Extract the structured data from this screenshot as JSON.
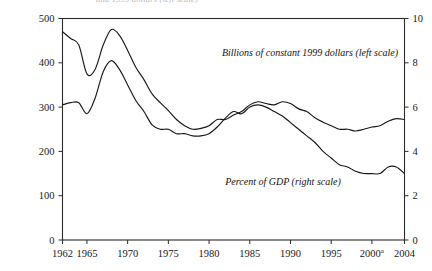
{
  "figure": {
    "top_clipped_caption": "and 1999 dollars (left scale)"
  },
  "chart_data": {
    "type": "line",
    "title": "",
    "subtitle": "",
    "xlabel": "",
    "ylabel": "",
    "grid": false,
    "legend_position": "inline-annotation",
    "x": [
      1962,
      1963,
      1964,
      1965,
      1966,
      1967,
      1968,
      1969,
      1970,
      1971,
      1972,
      1973,
      1974,
      1975,
      1976,
      1977,
      1978,
      1979,
      1980,
      1981,
      1982,
      1983,
      1984,
      1985,
      1986,
      1987,
      1988,
      1989,
      1990,
      1991,
      1992,
      1993,
      1994,
      1995,
      1996,
      1997,
      1998,
      1999,
      2000,
      2001,
      2002,
      2003,
      2004
    ],
    "xlim": [
      1962,
      2004
    ],
    "xticks": [
      1962,
      1965,
      1970,
      1975,
      1980,
      1985,
      1990,
      1995,
      2000,
      2004
    ],
    "xticklabels": [
      "1962",
      "1965",
      "1970",
      "1975",
      "1980",
      "1985",
      "1990",
      "1995",
      "2000",
      "2004"
    ],
    "xtick_superscripts": {
      "2000": "a"
    },
    "axes": [
      {
        "name": "left",
        "label": "Billions of constant 1999 dollars (left scale)",
        "ylim": [
          0,
          500
        ],
        "yticks": [
          0,
          100,
          200,
          300,
          400,
          500
        ],
        "yticklabels": [
          "0",
          "100",
          "200",
          "300",
          "400",
          "500"
        ]
      },
      {
        "name": "right",
        "label": "Percent of GDP (right scale)",
        "ylim": [
          0,
          10
        ],
        "yticks": [
          0,
          2,
          4,
          6,
          8,
          10
        ],
        "yticklabels": [
          "0",
          "2",
          "4",
          "6",
          "8",
          "10"
        ]
      }
    ],
    "series": [
      {
        "name": "Billions of constant 1999 dollars (left scale)",
        "axis": "left",
        "unit": "billions of constant 1999 dollars",
        "color": "#191919",
        "annotation": "Billions of constant 1999 dollars (left scale)",
        "values": [
          470,
          455,
          440,
          375,
          385,
          440,
          475,
          462,
          428,
          390,
          362,
          330,
          310,
          292,
          272,
          258,
          250,
          252,
          258,
          272,
          272,
          282,
          290,
          305,
          312,
          308,
          305,
          312,
          308,
          296,
          290,
          276,
          266,
          258,
          250,
          250,
          246,
          250,
          255,
          258,
          268,
          274,
          272
        ]
      },
      {
        "name": "Percent of GDP (right scale)",
        "axis": "right",
        "unit": "percent of GDP",
        "color": "#191919",
        "annotation": "Percent of GDP (right scale)",
        "values": [
          6.1,
          6.2,
          6.2,
          5.7,
          6.4,
          7.6,
          8.1,
          7.7,
          7.0,
          6.3,
          5.8,
          5.2,
          5.0,
          5.0,
          4.8,
          4.8,
          4.7,
          4.7,
          4.8,
          5.1,
          5.5,
          5.8,
          5.7,
          6.0,
          6.1,
          6.0,
          5.8,
          5.6,
          5.3,
          5.0,
          4.7,
          4.4,
          4.0,
          3.7,
          3.4,
          3.3,
          3.1,
          3.0,
          3.0,
          3.0,
          3.3,
          3.3,
          3.0
        ]
      }
    ]
  }
}
